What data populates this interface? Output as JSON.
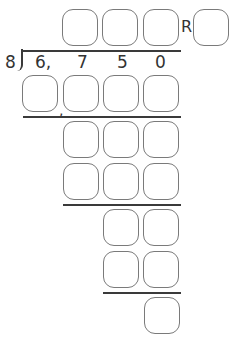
{
  "problem": {
    "divisor": "8",
    "dividend_digits": [
      "6,",
      "7",
      "5",
      "0"
    ],
    "remainder_label": "R",
    "comma": ","
  },
  "answer_boxes": {
    "quotient": [
      "",
      "",
      ""
    ],
    "remainder": [
      ""
    ],
    "step1_product": [
      "",
      "",
      "",
      ""
    ],
    "step2_difference": [
      "",
      "",
      ""
    ],
    "step2_product": [
      "",
      "",
      ""
    ],
    "step3_difference": [
      "",
      ""
    ],
    "step3_product": [
      "",
      ""
    ],
    "final_remainder": [
      ""
    ]
  },
  "colors": {
    "box_border": "#7a7a7a",
    "line": "#3a3a3a",
    "text": "#333333"
  }
}
